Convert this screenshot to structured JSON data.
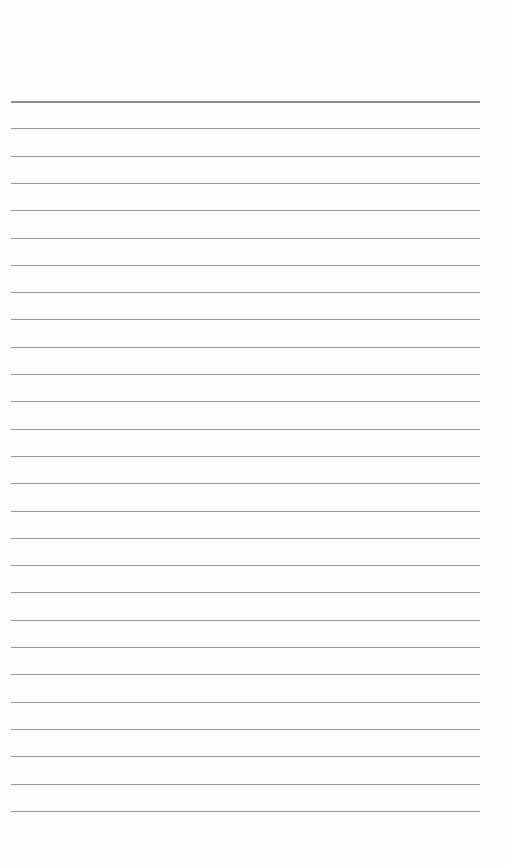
{
  "page": {
    "type": "blank-ruled-sheet",
    "background_color": "#fefefe",
    "rules": {
      "count": 27,
      "header_rule_y": 101,
      "first_y": 101,
      "spacing": 27.3,
      "left": 11,
      "right": 480,
      "color": "#9a9a9a",
      "header_color": "#8c8c8c"
    }
  }
}
